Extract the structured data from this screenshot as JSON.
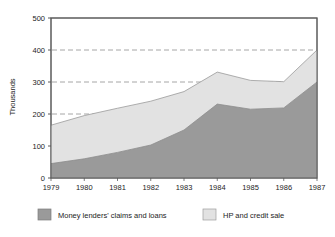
{
  "chart_data": {
    "type": "area",
    "stacked": true,
    "title": "",
    "subtitle": "",
    "xlabel": "",
    "ylabel": "Thousands",
    "categories": [
      "1979",
      "1980",
      "1981",
      "1982",
      "1983",
      "1984",
      "1985",
      "1986",
      "1987"
    ],
    "x": [
      1979,
      1980,
      1981,
      1982,
      1983,
      1984,
      1985,
      1986,
      1987
    ],
    "series": [
      {
        "name": "Money lenders' claims and loans",
        "color": "#9a9a9a",
        "values": [
          45,
          60,
          80,
          103,
          150,
          231,
          215,
          219,
          300
        ]
      },
      {
        "name": "HP and credit sale",
        "color": "#e2e2e2",
        "values": [
          120,
          135,
          138,
          137,
          120,
          100,
          90,
          82,
          100
        ]
      }
    ],
    "totals": [
      165,
      195,
      218,
      240,
      270,
      331,
      305,
      301,
      400
    ],
    "ylim": [
      0,
      500
    ],
    "yticks": [
      0,
      100,
      200,
      300,
      400,
      500
    ],
    "ytick_labels": [
      "0",
      "100",
      "200",
      "300",
      "400",
      "500"
    ],
    "xtick_labels": [
      "1979",
      "1980",
      "1981",
      "1982",
      "1983",
      "1984",
      "1985",
      "1986",
      "1987"
    ],
    "grid": {
      "horizontal": true,
      "style": "dashed",
      "values": [
        200,
        300,
        400
      ],
      "color": "#8f8f8f"
    },
    "legend": {
      "position": "bottom",
      "entries": [
        {
          "label": "Money lenders' claims and loans",
          "color": "#9a9a9a",
          "swatch": "filled"
        },
        {
          "label": "HP and credit sale",
          "color": "#e2e2e2",
          "swatch": "filled"
        }
      ]
    },
    "plot_frame_color": "#5a5a5a",
    "background": "#ffffff"
  }
}
